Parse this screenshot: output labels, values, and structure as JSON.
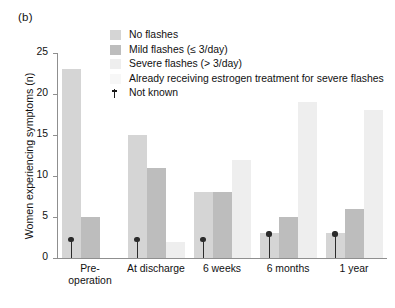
{
  "panel": {
    "label": "(b)"
  },
  "legend": {
    "items": [
      {
        "label": "No flashes",
        "color": "#d5d5d5",
        "swatch_name": "legend-swatch-no-flashes"
      },
      {
        "label": "Mild flashes (≤ 3/day)",
        "color": "#bdbdbd",
        "swatch_name": "legend-swatch-mild-flashes"
      },
      {
        "label": "Severe flashes (> 3/day)",
        "color": "#eeeeee",
        "swatch_name": "legend-swatch-severe-flashes"
      },
      {
        "label": "Already receiving estrogen treatment for severe flashes",
        "color": "#f7f7f7",
        "swatch_name": "legend-swatch-estrogen-treatment"
      }
    ],
    "marker": {
      "label": "Not known",
      "symbol": "†",
      "color": "#1a1a1a"
    }
  },
  "chart_data": {
    "type": "bar",
    "title": "(b)",
    "xlabel": "",
    "ylabel": "Women experiencing symptoms (n)",
    "ylim": [
      0,
      25
    ],
    "yticks": [
      0,
      5,
      10,
      15,
      20,
      25
    ],
    "grid": false,
    "legend_position": "top-right",
    "categories": [
      "Pre-operation",
      "At discharge",
      "6 weeks",
      "6 months",
      "1 year"
    ],
    "category_labels": [
      [
        "Pre-",
        "operation"
      ],
      [
        "At discharge"
      ],
      [
        "6 weeks"
      ],
      [
        "6 months"
      ],
      [
        "1 year"
      ]
    ],
    "series": [
      {
        "name": "No flashes",
        "color": "#d5d5d5",
        "values": [
          23,
          15,
          8,
          3,
          3
        ]
      },
      {
        "name": "Mild flashes (≤ 3/day)",
        "color": "#bdbdbd",
        "values": [
          5,
          11,
          8,
          5,
          6
        ]
      },
      {
        "name": "Severe flashes (> 3/day)",
        "color": "#eeeeee",
        "values": [
          null,
          2,
          12,
          19,
          18
        ]
      },
      {
        "name": "Already receiving estrogen treatment for severe flashes",
        "color": "#f7f7f7",
        "values": [
          null,
          null,
          null,
          null,
          null
        ]
      }
    ],
    "annotations": [
      {
        "type": "not-known-marker",
        "category": "Pre-operation",
        "series": "No flashes",
        "height": 2.6
      },
      {
        "type": "not-known-marker",
        "category": "At discharge",
        "series": "No flashes",
        "height": 2.6
      },
      {
        "type": "not-known-marker",
        "category": "6 weeks",
        "series": "No flashes",
        "height": 2.6
      },
      {
        "type": "not-known-marker",
        "category": "6 months",
        "series": "No flashes",
        "height": 3.3
      },
      {
        "type": "not-known-marker",
        "category": "1 year",
        "series": "No flashes",
        "height": 3.3
      }
    ]
  }
}
